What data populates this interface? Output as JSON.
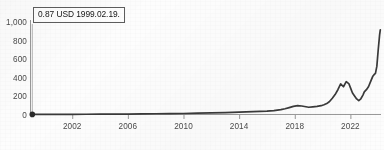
{
  "chart_data": {
    "type": "line",
    "title": "",
    "subtitle": "",
    "xlabel": "",
    "ylabel": "",
    "xlim": [
      1999.0,
      2024.2
    ],
    "ylim": [
      0,
      1000
    ],
    "grid": false,
    "legend": null,
    "legend_position": "none",
    "line_color": "#3a3a3a",
    "axis_color": "#8e8e8e",
    "x_tick_labels": [
      "2002",
      "2006",
      "2010",
      "2014",
      "2018",
      "2022"
    ],
    "x_tick_values": [
      2002,
      2006,
      2010,
      2014,
      2018,
      2022
    ],
    "y_tick_labels": [
      "0",
      "200",
      "400",
      "600",
      "800",
      "1,000"
    ],
    "y_tick_values": [
      0,
      200,
      400,
      600,
      800,
      1000
    ],
    "highlighted_point": {
      "x": 1999.13,
      "y": 0.87,
      "label": "0.87 USD 1999.02.19.",
      "value": 0.87,
      "unit": "USD",
      "date": "1999.02.19."
    },
    "series": [
      {
        "name": "price",
        "x": [
          1999.13,
          2000.0,
          2001.0,
          2002.0,
          2003.0,
          2004.0,
          2005.0,
          2006.0,
          2007.0,
          2008.0,
          2009.0,
          2010.0,
          2011.0,
          2012.0,
          2013.0,
          2014.0,
          2015.0,
          2016.0,
          2016.5,
          2017.0,
          2017.3,
          2017.6,
          2017.9,
          2018.2,
          2018.5,
          2018.8,
          2019.0,
          2019.3,
          2019.6,
          2019.9,
          2020.1,
          2020.3,
          2020.5,
          2020.7,
          2020.9,
          2021.1,
          2021.3,
          2021.5,
          2021.7,
          2021.9,
          2022.0,
          2022.15,
          2022.3,
          2022.45,
          2022.6,
          2022.75,
          2022.9,
          2023.0,
          2023.15,
          2023.3,
          2023.45,
          2023.6,
          2023.7,
          2023.8,
          2023.9,
          2024.0,
          2024.1,
          2024.15
        ],
        "y": [
          0.87,
          1.2,
          1.5,
          2.0,
          2.5,
          3.2,
          4.0,
          5.0,
          6.5,
          8.0,
          9.0,
          11.0,
          14.0,
          17.0,
          21.0,
          26.0,
          30.0,
          36.0,
          42.0,
          52.0,
          62.0,
          75.0,
          88.0,
          96.0,
          92.0,
          84.0,
          78.0,
          83.0,
          88.0,
          95.0,
          105.0,
          118.0,
          140.0,
          175.0,
          215.0,
          268.0,
          330.0,
          300.0,
          355.0,
          330.0,
          290.0,
          232.0,
          200.0,
          168.0,
          150.0,
          170.0,
          210.0,
          245.0,
          268.0,
          300.0,
          355.0,
          410.0,
          430.0,
          445.0,
          520.0,
          700.0,
          860.0,
          915.0
        ]
      }
    ]
  }
}
